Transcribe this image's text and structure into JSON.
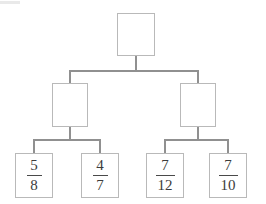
{
  "diagram": {
    "type": "tree",
    "background_color": "#ffffff",
    "box_border_color": "#b9b9b9",
    "edge_color": "#909090",
    "text_color": "#3b3b3b"
  },
  "nodes": {
    "root": {
      "id": "root",
      "label": "",
      "numerator": "",
      "denominator": "",
      "x": 117,
      "y": 13,
      "width": 38,
      "height": 43
    },
    "left_branch": {
      "id": "left-branch",
      "label": "",
      "numerator": "",
      "denominator": "",
      "x": 52,
      "y": 83,
      "width": 36,
      "height": 44
    },
    "right_branch": {
      "id": "right-branch",
      "label": "",
      "numerator": "",
      "denominator": "",
      "x": 180,
      "y": 83,
      "width": 36,
      "height": 44
    },
    "leaf_1": {
      "id": "leaf-5-8",
      "label": "5/8",
      "numerator": "5",
      "denominator": "8",
      "x": 15,
      "y": 153,
      "width": 38,
      "height": 45
    },
    "leaf_2": {
      "id": "leaf-4-7",
      "label": "4/7",
      "numerator": "4",
      "denominator": "7",
      "x": 81,
      "y": 153,
      "width": 38,
      "height": 45
    },
    "leaf_3": {
      "id": "leaf-7-12",
      "label": "7/12",
      "numerator": "7",
      "denominator": "12",
      "x": 146,
      "y": 153,
      "width": 38,
      "height": 45
    },
    "leaf_4": {
      "id": "leaf-7-10",
      "label": "7/10",
      "numerator": "7",
      "denominator": "10",
      "x": 209,
      "y": 153,
      "width": 38,
      "height": 45
    }
  },
  "edges": {
    "root_stem": {
      "x1": 136,
      "y1": 56,
      "x2": 136,
      "y2": 71
    },
    "root_bus": {
      "x1": 70,
      "y1": 71,
      "x2": 198,
      "y2": 71
    },
    "left_drop": {
      "x1": 70,
      "y1": 71,
      "x2": 70,
      "y2": 83
    },
    "right_drop": {
      "x1": 198,
      "y1": 71,
      "x2": 198,
      "y2": 83
    },
    "left_stem": {
      "x1": 70,
      "y1": 127,
      "x2": 70,
      "y2": 140
    },
    "left_bus": {
      "x1": 34,
      "y1": 140,
      "x2": 100,
      "y2": 140
    },
    "leaf1_drop": {
      "x1": 34,
      "y1": 140,
      "x2": 34,
      "y2": 153
    },
    "leaf2_drop": {
      "x1": 100,
      "y1": 140,
      "x2": 100,
      "y2": 153
    },
    "right_stem": {
      "x1": 198,
      "y1": 127,
      "x2": 198,
      "y2": 140
    },
    "right_bus": {
      "x1": 165,
      "y1": 140,
      "x2": 228,
      "y2": 140
    },
    "leaf3_drop": {
      "x1": 165,
      "y1": 140,
      "x2": 165,
      "y2": 153
    },
    "leaf4_drop": {
      "x1": 228,
      "y1": 140,
      "x2": 228,
      "y2": 153
    }
  }
}
